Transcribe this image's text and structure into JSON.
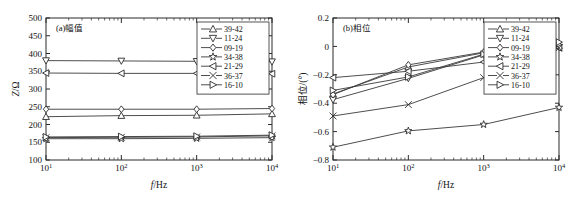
{
  "figure": {
    "background": "#ffffff",
    "line_color": "#3a3a3a",
    "axis_color": "#2b2b2b"
  },
  "chart_data": [
    {
      "type": "line",
      "title": "(a)幅值",
      "panel_label": "(a)",
      "xlabel": "f/Hz",
      "xlabel_italic_part": "f",
      "xlabel_rest": "/Hz",
      "ylabel": "Z/Ω",
      "ylabel_italic_part": "Z",
      "ylabel_rest": "/Ω",
      "xscale": "log",
      "xlim": [
        10,
        10000
      ],
      "ylim": [
        100,
        500
      ],
      "yticks": [
        100,
        150,
        200,
        250,
        300,
        350,
        400,
        450,
        500
      ],
      "ytick_labels": [
        "100",
        "150",
        "200",
        "250",
        "300",
        "350",
        "400",
        "450",
        "500"
      ],
      "xticks": [
        10,
        100,
        1000,
        10000
      ],
      "xtick_labels": [
        "10¹",
        "10²",
        "10³",
        "10⁴"
      ],
      "xtick_mantissa": "10",
      "xtick_exponents": [
        "1",
        "2",
        "3",
        "4"
      ],
      "grid": false,
      "legend_position": "upper right",
      "x": [
        10,
        100,
        1000,
        10000
      ],
      "series": [
        {
          "name": "39-42",
          "marker": "triangle-up",
          "values": [
            222,
            225,
            226,
            230
          ]
        },
        {
          "name": "11-24",
          "marker": "triangle-down",
          "values": [
            380,
            379,
            378,
            377
          ]
        },
        {
          "name": "09-19",
          "marker": "diamond",
          "values": [
            243,
            243,
            243,
            245
          ]
        },
        {
          "name": "34-38",
          "marker": "star",
          "values": [
            160,
            160,
            161,
            163
          ]
        },
        {
          "name": "21-29",
          "marker": "triangle-left",
          "values": [
            345,
            344,
            344,
            343
          ]
        },
        {
          "name": "36-37",
          "marker": "x",
          "values": [
            163,
            164,
            165,
            168
          ]
        },
        {
          "name": "16-10",
          "marker": "triangle-right",
          "values": [
            165,
            166,
            167,
            170
          ]
        }
      ]
    },
    {
      "type": "line",
      "title": "(b)相位",
      "panel_label": "(b)",
      "xlabel": "f/Hz",
      "xlabel_italic_part": "f",
      "xlabel_rest": "/Hz",
      "ylabel": "相位/(°)",
      "xscale": "log",
      "xlim": [
        10,
        10000
      ],
      "ylim": [
        -0.8,
        0.2
      ],
      "yticks": [
        -0.8,
        -0.6,
        -0.4,
        -0.2,
        0,
        0.2
      ],
      "ytick_labels": [
        "−0.8",
        "−0.6",
        "−0.4",
        "−0.2",
        "0",
        "0.2"
      ],
      "xticks": [
        10,
        100,
        1000,
        10000
      ],
      "xtick_labels": [
        "10¹",
        "10²",
        "10³",
        "10⁴"
      ],
      "xtick_mantissa": "10",
      "xtick_exponents": [
        "1",
        "2",
        "3",
        "4"
      ],
      "grid": false,
      "legend_position": "upper right",
      "x": [
        10,
        100,
        1000,
        10000
      ],
      "series": [
        {
          "name": "39-42",
          "marker": "triangle-up",
          "values": [
            -0.335,
            -0.145,
            -0.045,
            0.005
          ]
        },
        {
          "name": "11-24",
          "marker": "triangle-down",
          "values": [
            -0.375,
            -0.225,
            -0.06,
            -0.005
          ]
        },
        {
          "name": "09-19",
          "marker": "diamond",
          "values": [
            -0.34,
            -0.13,
            -0.04,
            0.01
          ]
        },
        {
          "name": "34-38",
          "marker": "star",
          "values": [
            -0.71,
            -0.595,
            -0.55,
            -0.43
          ]
        },
        {
          "name": "21-29",
          "marker": "triangle-left",
          "values": [
            -0.22,
            -0.175,
            -0.11,
            -0.01
          ]
        },
        {
          "name": "36-37",
          "marker": "x",
          "values": [
            -0.49,
            -0.41,
            -0.22,
            -0.01
          ]
        },
        {
          "name": "16-10",
          "marker": "triangle-right",
          "values": [
            -0.31,
            -0.215,
            -0.055,
            0.03
          ]
        }
      ]
    }
  ]
}
